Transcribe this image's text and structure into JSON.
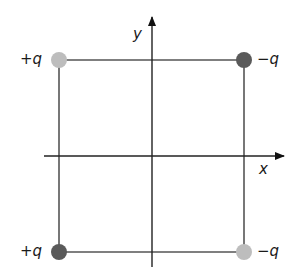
{
  "diagram": {
    "title": "",
    "axes": {
      "x_label": "x",
      "y_label": "y"
    },
    "charges": [
      {
        "position": "top-left",
        "label": "+q",
        "color": "#bdbdbd"
      },
      {
        "position": "top-right",
        "label": "−q",
        "color": "#5a5a5a"
      },
      {
        "position": "bottom-left",
        "label": "+q",
        "color": "#5a5a5a"
      },
      {
        "position": "bottom-right",
        "label": "−q",
        "color": "#bdbdbd"
      }
    ],
    "colors": {
      "square_line": "#555555",
      "axis_line": "#222222",
      "light_charge": "#bdbdbd",
      "dark_charge": "#5a5a5a"
    }
  }
}
